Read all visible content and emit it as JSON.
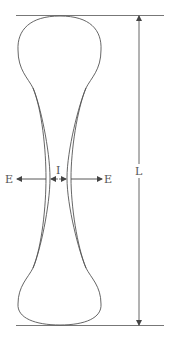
{
  "diagram": {
    "type": "dog-bone specimen / elongated body schematic",
    "labels": {
      "left_force": "E",
      "right_force": "E",
      "gap": "I",
      "length": "L"
    },
    "colors": {
      "stroke": "#555555",
      "background": "#ffffff"
    }
  }
}
